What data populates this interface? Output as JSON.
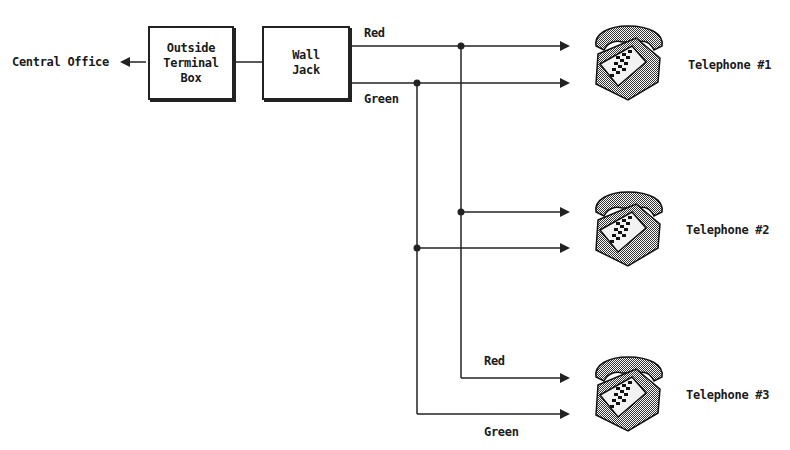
{
  "diagram": {
    "central_office": "Central Office",
    "outside_box": {
      "line1": "Outside",
      "line2": "Terminal",
      "line3": "Box"
    },
    "wall_jack": {
      "line1": "Wall",
      "line2": "Jack"
    },
    "wire_labels": {
      "red_top": "Red",
      "green_top": "Green",
      "red_bottom": "Red",
      "green_bottom": "Green"
    },
    "telephones": [
      {
        "label": "Telephone #1"
      },
      {
        "label": "Telephone #2"
      },
      {
        "label": "Telephone #3"
      }
    ],
    "colors": {
      "line": "#222222",
      "phone_dark": "#4a4a4a",
      "phone_light": "#e8e8e8"
    }
  }
}
